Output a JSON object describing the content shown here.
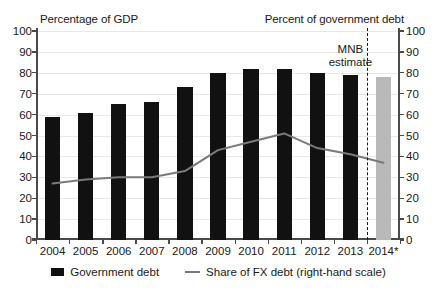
{
  "chart_data": {
    "type": "bar",
    "title": "",
    "left_axis_title": "Percentage of GDP",
    "right_axis_title": "Percent of government debt",
    "xlabel": "",
    "ylabel": "",
    "categories": [
      "2004",
      "2005",
      "2006",
      "2007",
      "2008",
      "2009",
      "2010",
      "2011",
      "2012",
      "2013",
      "2014*"
    ],
    "ylim": [
      0,
      100
    ],
    "y2lim": [
      0,
      100
    ],
    "yticks": [
      0,
      10,
      20,
      30,
      40,
      50,
      60,
      70,
      80,
      90,
      100
    ],
    "y2ticks": [
      0,
      10,
      20,
      30,
      40,
      50,
      60,
      70,
      80,
      90,
      100
    ],
    "grid": true,
    "legend_position": "bottom",
    "series": [
      {
        "name": "Government debt",
        "type": "bar",
        "axis": "left",
        "color": "#111111",
        "forecast_color": "#b9b9b9",
        "values": [
          59,
          61,
          65,
          66,
          73,
          80,
          82,
          82,
          80,
          79,
          78
        ],
        "forecast_index": 10
      },
      {
        "name": "Share of FX debt (right-hand scale)",
        "type": "line",
        "axis": "right",
        "color": "#7a7a7a",
        "values": [
          27,
          29,
          30,
          30,
          33,
          43,
          47,
          51,
          44,
          41,
          37
        ]
      }
    ],
    "annotations": [
      {
        "name": "mnb-estimate",
        "text_line1": "MNB",
        "text_line2": "estimate"
      },
      {
        "name": "forecast-divider",
        "type": "vertical-dashed-line",
        "after_category": "2013"
      }
    ]
  },
  "legend": {
    "items": [
      {
        "label": "Government debt",
        "marker": "bar-swatch"
      },
      {
        "label": "Share of FX debt (right-hand scale)",
        "marker": "line-swatch"
      }
    ]
  }
}
